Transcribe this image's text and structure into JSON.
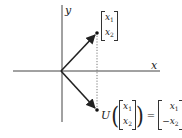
{
  "diagram": {
    "type": "vector reflection across x-axis",
    "axes": {
      "x_label": "x",
      "y_label": "y",
      "origin": [
        61,
        71
      ],
      "x_range_px": [
        13,
        160
      ],
      "y_range_px": [
        5,
        122
      ]
    },
    "vectors": [
      {
        "name": "original",
        "from": [
          61,
          71
        ],
        "to": [
          97,
          33
        ],
        "label_top": "x",
        "label_top_sub": "1",
        "label_bottom": "x",
        "label_bottom_sub": "2"
      },
      {
        "name": "reflected",
        "from": [
          61,
          71
        ],
        "to": [
          97,
          110
        ]
      }
    ],
    "dotted_line": {
      "x": 97,
      "y1": 33,
      "y2": 110
    },
    "equation": {
      "operator": "U",
      "input_top": "x",
      "input_top_sub": "1",
      "input_bottom": "x",
      "input_bottom_sub": "2",
      "equals": "=",
      "output_top": "x",
      "output_top_sub": "1",
      "output_bottom_sign": "−",
      "output_bottom": "x",
      "output_bottom_sub": "2"
    },
    "colors": {
      "line": "#333333",
      "vector": "#222222",
      "dotted": "#555555"
    }
  }
}
